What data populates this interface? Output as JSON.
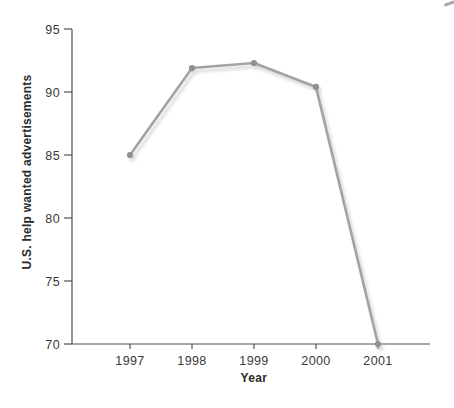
{
  "chart_data": {
    "type": "line",
    "title": "",
    "xlabel": "Year",
    "ylabel": "U.S. help wanted advertisements",
    "categories": [
      "1997",
      "1998",
      "1999",
      "2000",
      "2001"
    ],
    "values": [
      85,
      91.9,
      92.3,
      90.4,
      70
    ],
    "ylim": [
      70,
      95
    ],
    "yticks": [
      70,
      75,
      80,
      85,
      90,
      95
    ],
    "grid": false,
    "legend": "none",
    "colors": {
      "background": "#ffffff",
      "line": "#a3a3a3",
      "marker": "#909090",
      "shadow": "#bdbdbd",
      "axis": "#4f4f4f",
      "tick_text": "#3a3a3a",
      "label_text": "#2b2b2b"
    }
  }
}
